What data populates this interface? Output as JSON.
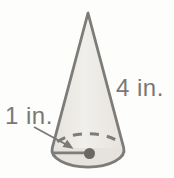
{
  "figure": {
    "shape": "cone",
    "labels": {
      "slant_height": "4 in.",
      "radius": "1 in."
    },
    "colors": {
      "background": "#fdfdfc",
      "fill_light": "#f1efeb",
      "fill_dark": "#e6e3de",
      "outline": "#7e7c79",
      "text": "#7a7875",
      "dot": "#6a6865"
    }
  }
}
